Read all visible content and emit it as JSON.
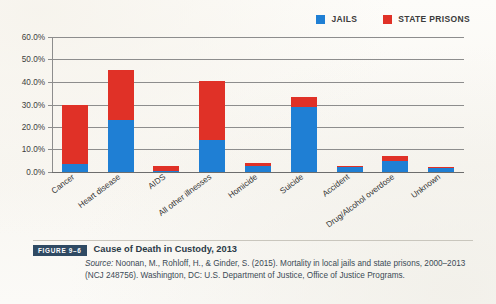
{
  "legend": {
    "items": [
      {
        "label": "JAILS",
        "color": "#1f7fd4",
        "icon": "square-swatch-icon"
      },
      {
        "label": "STATE PRISONS",
        "color": "#e03127",
        "icon": "square-swatch-icon"
      }
    ]
  },
  "axis": {
    "y_ticks": [
      "0.0%",
      "10.0%",
      "20.0%",
      "30.0%",
      "40.0%",
      "50.0%",
      "60.0%"
    ]
  },
  "caption": {
    "figure_label": "FIGURE 9–6",
    "title": "Cause of Death in Custody, 2013",
    "source_prefix": "Source:",
    "source_line1": " Noonan, M., Rohloff, H., & Ginder, S. (2015). Mortality in local jails and",
    "source_line2": "state prisons, 2000–2013 (NCJ 248756). Washington, DC: U.S. Department of",
    "source_line3": "Justice, Office of Justice Programs."
  },
  "chart_data": {
    "type": "bar",
    "subtype": "stacked-column",
    "title": "Cause of Death in Custody, 2013",
    "xlabel": "",
    "ylabel": "",
    "ylim": [
      0,
      60
    ],
    "ytick_step": 10,
    "ytick_format": "percent-one-decimal",
    "grid": true,
    "legend_position": "top-right",
    "categories": [
      "Cancer",
      "Heart disease",
      "AIDS",
      "All other illnesses",
      "Homicide",
      "Suicide",
      "Accident",
      "Drug/Alcohol overdose",
      "Unknown"
    ],
    "series": [
      {
        "name": "JAILS",
        "color": "#1f7fd4",
        "values": [
          3.5,
          23.0,
          0.4,
          14.2,
          2.6,
          29.0,
          2.3,
          5.1,
          2.0
        ]
      },
      {
        "name": "STATE PRISONS",
        "color": "#e03127",
        "values": [
          26.5,
          22.5,
          2.1,
          26.3,
          1.6,
          4.5,
          0.4,
          1.9,
          0.2
        ]
      }
    ],
    "totals": [
      30.0,
      45.5,
      2.5,
      40.5,
      4.2,
      33.5,
      2.7,
      7.0,
      2.2
    ]
  }
}
